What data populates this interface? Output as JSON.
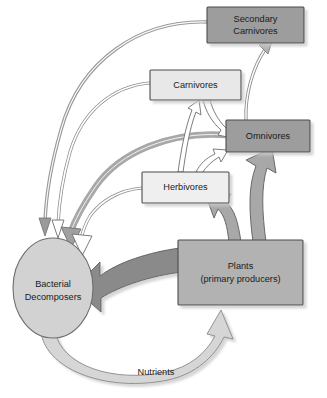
{
  "diagram": {
    "type": "food-web-diagram",
    "background_color": "#ffffff",
    "nodes": [
      {
        "id": "secondary_carnivores",
        "label_line1": "Secondary",
        "label_line2": "Carnivores",
        "shape": "rectangle",
        "fill": "#9d9d9d",
        "stroke": "#4a4a4a",
        "x": 207,
        "y": 7,
        "w": 97,
        "h": 36
      },
      {
        "id": "carnivores",
        "label_line1": "Carnivores",
        "label_line2": "",
        "shape": "rectangle",
        "fill": "#e8e8e8",
        "stroke": "#4a4a4a",
        "x": 150,
        "y": 70,
        "w": 91,
        "h": 30
      },
      {
        "id": "omnivores",
        "label_line1": "Omnivores",
        "label_line2": "",
        "shape": "rectangle",
        "fill": "#9d9d9d",
        "stroke": "#4a4a4a",
        "x": 226,
        "y": 120,
        "w": 84,
        "h": 32
      },
      {
        "id": "herbivores",
        "label_line1": "Herbivores",
        "label_line2": "",
        "shape": "rectangle",
        "fill": "#efefef",
        "stroke": "#4a4a4a",
        "x": 142,
        "y": 172,
        "w": 87,
        "h": 31
      },
      {
        "id": "plants",
        "label_line1": "Plants",
        "label_line2": "(primary producers)",
        "shape": "rectangle",
        "fill": "#b2b2b2",
        "stroke": "#4a4a4a",
        "x": 178,
        "y": 240,
        "w": 125,
        "h": 65
      },
      {
        "id": "bacterial_decomposers",
        "label_line1": "Bacterial",
        "label_line2": "Decomposers",
        "shape": "ellipse",
        "fill": "#d2d2d2",
        "stroke": "#6e6e6e",
        "cx": 53,
        "cy": 288,
        "rx": 40,
        "ry": 50
      }
    ],
    "edges": [
      {
        "id": "plants-to-decomposers",
        "from": "plants",
        "to": "bacterial_decomposers",
        "style": "thick-dark-curve",
        "fill": "#8a8a8a"
      },
      {
        "id": "plants-to-omnivores",
        "from": "plants",
        "to": "omnivores",
        "style": "thick-gray-curve",
        "fill": "#a8a8a8"
      },
      {
        "id": "plants-to-herbivores",
        "from": "plants",
        "to": "herbivores",
        "style": "thick-gray-curve",
        "fill": "#a8a8a8"
      },
      {
        "id": "decomposers-to-plants",
        "from": "bacterial_decomposers",
        "to": "plants",
        "label": "Nutrients",
        "style": "wide-light-band",
        "fill": "#d6d6d6"
      },
      {
        "id": "herbivores-to-carnivores",
        "from": "herbivores",
        "to": "carnivores",
        "style": "hollow-arrow",
        "fill": "#ffffff"
      },
      {
        "id": "herbivores-to-omnivores",
        "from": "herbivores",
        "to": "omnivores",
        "style": "hollow-arrow",
        "fill": "#ffffff"
      },
      {
        "id": "carnivores-to-omnivores",
        "from": "carnivores",
        "to": "omnivores",
        "style": "hollow-arrow",
        "fill": "#ffffff"
      },
      {
        "id": "omnivores-to-secondary-carnivores",
        "from": "omnivores",
        "to": "secondary_carnivores",
        "style": "thin-line",
        "fill": "#cccccc"
      },
      {
        "id": "secondary-carnivores-to-decomposers",
        "from": "secondary_carnivores",
        "to": "bacterial_decomposers",
        "style": "thin-arc",
        "fill": "#b8b8b8"
      },
      {
        "id": "carnivores-to-decomposers",
        "from": "carnivores",
        "to": "bacterial_decomposers",
        "style": "thin-arc-hollow",
        "fill": "#ffffff"
      },
      {
        "id": "omnivores-to-decomposers",
        "from": "omnivores",
        "to": "bacterial_decomposers",
        "style": "medium-arc",
        "fill": "#a8a8a8"
      },
      {
        "id": "herbivores-to-decomposers",
        "from": "herbivores",
        "to": "bacterial_decomposers",
        "style": "thin-arc-hollow",
        "fill": "#ffffff"
      }
    ],
    "edge_labels": {
      "nutrients": "Nutrients"
    }
  }
}
